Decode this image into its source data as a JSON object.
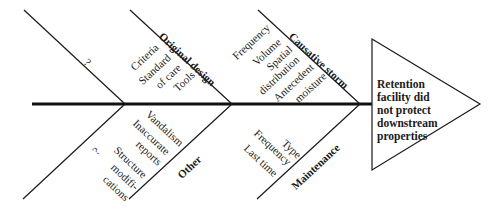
{
  "diagram": {
    "type": "fishbone",
    "effect": "Retention facility did not protect downstream properties",
    "effect_lines": [
      "Retention",
      "facility did",
      "not protect",
      "downstream",
      "properties"
    ],
    "categories": {
      "upper_left": {
        "label": "",
        "unknown_marker": "?",
        "causes": []
      },
      "upper_mid": {
        "label": "Original design",
        "causes": [
          "Criteria",
          "Standard",
          "of care",
          "Tools"
        ]
      },
      "upper_right": {
        "label": "Causative storm",
        "causes": [
          "Frequency",
          "Volume",
          "Spatial",
          "distribution",
          "Antecedent",
          "moisture"
        ]
      },
      "lower_left": {
        "label": "",
        "unknown_marker": "?",
        "causes": []
      },
      "lower_mid": {
        "label": "Other",
        "causes": [
          "Vandalism",
          "Inaccurate",
          "reports",
          "Structure",
          "modifi-",
          "cations"
        ]
      },
      "lower_right": {
        "label": "Maintenance",
        "causes": [
          "Type",
          "Frequency",
          "Last time"
        ]
      }
    },
    "colors": {
      "line": "#1a1a1a",
      "spine": "#111111",
      "background": "#ffffff"
    }
  }
}
